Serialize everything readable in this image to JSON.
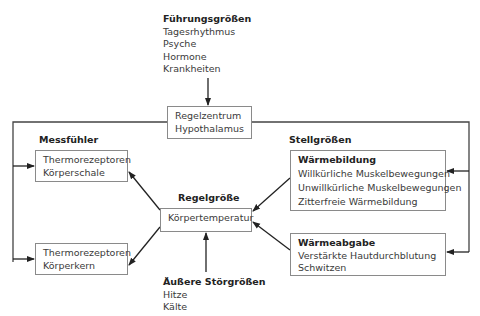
{
  "diagram": {
    "fuehrungsgroessen": {
      "title": "Führungsgrößen",
      "items": [
        "Tagesrhythmus",
        "Psyche",
        "Hormone",
        "Krankheiten"
      ]
    },
    "regelzentrum": {
      "lines": [
        "Regelzentrum",
        "Hypothalamus"
      ]
    },
    "messfuehler": {
      "label": "Messfühler",
      "schale": [
        "Thermorezeptoren",
        "Körperschale"
      ],
      "kern": [
        "Thermorezeptoren",
        "Körperkern"
      ]
    },
    "regelgroesse": {
      "label": "Regelgröße",
      "value": "Körpertemperatur"
    },
    "stellgroessen": {
      "label": "Stellgrößen",
      "waermebildung": {
        "title": "Wärmebildung",
        "items": [
          "Willkürliche Muskelbewegungen",
          "Unwillkürliche Muskelbewegungen",
          "Zitterfreie Wärmebildung"
        ]
      },
      "waermeabgabe": {
        "title": "Wärmeabgabe",
        "items": [
          "Verstärkte Hautdurchblutung",
          "Schwitzen"
        ]
      }
    },
    "stoergroessen": {
      "title": "Äußere Störgrößen",
      "items": [
        "Hitze",
        "Kälte"
      ]
    }
  },
  "colors": {
    "line": "#222222",
    "box_border": "#8a8a8a",
    "text": "#3a3a3a"
  }
}
